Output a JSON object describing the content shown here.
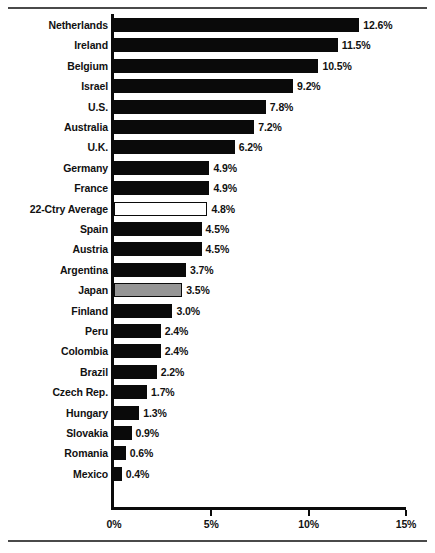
{
  "chart_data": {
    "type": "bar",
    "orientation": "horizontal",
    "title": "",
    "subtitle": "",
    "xlabel": "",
    "ylabel": "",
    "xlim": [
      0,
      15
    ],
    "xticks": [
      0,
      5,
      10,
      15
    ],
    "xtick_labels": [
      "0%",
      "5%",
      "10%",
      "15%"
    ],
    "grid": false,
    "legend": null,
    "value_label_suffix": "%",
    "categories": [
      "Netherlands",
      "Ireland",
      "Belgium",
      "Israel",
      "U.S.",
      "Australia",
      "U.K.",
      "Germany",
      "France",
      "22-Ctry Average",
      "Spain",
      "Austria",
      "Argentina",
      "Japan",
      "Finland",
      "Peru",
      "Colombia",
      "Brazil",
      "Czech Rep.",
      "Hungary",
      "Slovakia",
      "Romania",
      "Mexico"
    ],
    "values": [
      12.6,
      11.5,
      10.5,
      9.2,
      7.8,
      7.2,
      6.2,
      4.9,
      4.9,
      4.8,
      4.5,
      4.5,
      3.7,
      3.5,
      3.0,
      2.4,
      2.4,
      2.2,
      1.7,
      1.3,
      0.9,
      0.6,
      0.4
    ],
    "value_labels": [
      "12.6%",
      "11.5%",
      "10.5%",
      "9.2%",
      "7.8%",
      "7.2%",
      "6.2%",
      "4.9%",
      "4.9%",
      "4.8%",
      "4.5%",
      "4.5%",
      "3.7%",
      "3.5%",
      "3.0%",
      "2.4%",
      "2.4%",
      "2.2%",
      "1.7%",
      "1.3%",
      "0.9%",
      "0.6%",
      "0.4%"
    ],
    "bar_styles": [
      "black",
      "black",
      "black",
      "black",
      "black",
      "black",
      "black",
      "black",
      "black",
      "white",
      "black",
      "black",
      "black",
      "gray",
      "black",
      "black",
      "black",
      "black",
      "black",
      "black",
      "black",
      "black",
      "black"
    ],
    "colors": {
      "bar_black": "#0a0a0a",
      "bar_gray": "#969696",
      "bar_white": "#ffffff",
      "bar_outline": "#0a0a0a",
      "axis": "#0a0a0a",
      "text": "#111111",
      "rule": "#4a4a4a",
      "background": "#ffffff"
    },
    "highlighted": [
      {
        "category": "22-Ctry Average",
        "style": "white"
      },
      {
        "category": "Japan",
        "style": "gray"
      }
    ]
  }
}
